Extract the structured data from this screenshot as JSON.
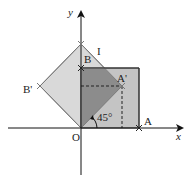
{
  "diagram": {
    "type": "geometry-rotation",
    "axes": {
      "x_label": "x",
      "y_label": "y",
      "origin_label": "O"
    },
    "points": {
      "O": "O",
      "A": "A",
      "B": "B",
      "A_prime": "A'",
      "B_prime": "B'",
      "I": "I"
    },
    "angle_label": "45°",
    "colors": {
      "square_fill": "#c4c4c4",
      "rotated_fill": "#d9d9d9",
      "overlap_fill": "#8c8c8c",
      "stroke": "#333333",
      "rotated_stroke": "#7a7a7a"
    }
  }
}
